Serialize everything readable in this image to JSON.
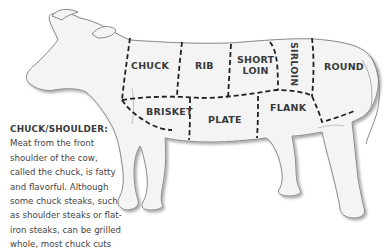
{
  "diagram": {
    "cuts": [
      {
        "id": "chuck",
        "label": "CHUCK"
      },
      {
        "id": "rib",
        "label": "RIB"
      },
      {
        "id": "short_loin",
        "label_line1": "SHORT",
        "label_line2": "LOIN"
      },
      {
        "id": "sirloin",
        "label": "SIRLOIN"
      },
      {
        "id": "round",
        "label": "ROUND"
      },
      {
        "id": "brisket",
        "label": "BRISKET"
      },
      {
        "id": "plate",
        "label": "PLATE"
      },
      {
        "id": "flank",
        "label": "FLANK"
      }
    ],
    "colors": {
      "outline": "#8a8a8a",
      "fill": "#f4f4f4",
      "dash": "#222222",
      "label": "#3a3a3a"
    }
  },
  "description": {
    "title": "CHUCK/SHOULDER:",
    "lines": [
      "Meat from the front",
      "shoulder of the cow,",
      "called the chuck, is fatty",
      "and flavorful. Although",
      "some chuck steaks, such",
      "as shoulder steaks or flat-",
      "iron steaks, can be grilled",
      "whole, most chuck cuts"
    ]
  }
}
